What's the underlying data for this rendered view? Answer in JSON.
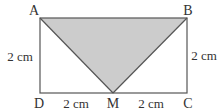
{
  "diagram": {
    "type": "geometry-figure",
    "shape": "rectangle ABCD with shaded triangle ABM",
    "points": {
      "A": {
        "label": "A",
        "x": 40,
        "y": 18
      },
      "B": {
        "label": "B",
        "x": 187,
        "y": 18
      },
      "C": {
        "label": "C",
        "x": 187,
        "y": 93
      },
      "D": {
        "label": "D",
        "x": 40,
        "y": 93
      },
      "M": {
        "label": "M",
        "x": 113,
        "y": 93
      }
    },
    "measurements": {
      "AD": "2 cm",
      "BC": "2 cm",
      "DM": "2 cm",
      "MC": "2 cm"
    },
    "colors": {
      "stroke": "#555555",
      "shade": "#cccccc",
      "text": "#333333"
    }
  }
}
